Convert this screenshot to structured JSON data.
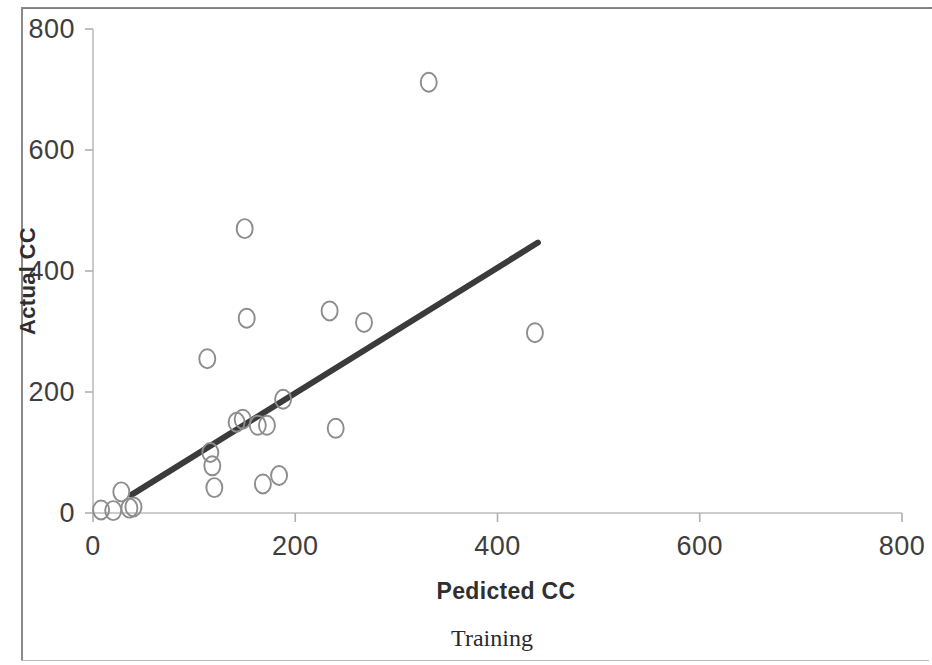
{
  "chart_data": {
    "type": "scatter",
    "title": "",
    "subtitle": "",
    "caption": "Training",
    "xlabel": "Pedicted CC",
    "ylabel": "Actual CC",
    "xlim": [
      0,
      800
    ],
    "ylim": [
      0,
      800
    ],
    "xticks": [
      0,
      200,
      400,
      600,
      800
    ],
    "yticks": [
      0,
      200,
      400,
      600,
      800
    ],
    "xtick_labels": [
      "0",
      "200",
      "400",
      "600",
      "800"
    ],
    "ytick_labels": [
      "0",
      "200",
      "400",
      "600",
      "800"
    ],
    "grid": false,
    "legend": null,
    "marker": {
      "shape": "open-circle",
      "stroke_color": "#8d8d8d",
      "fill": "none",
      "size": 18
    },
    "points": [
      {
        "x": 8,
        "y": 5
      },
      {
        "x": 20,
        "y": 4
      },
      {
        "x": 28,
        "y": 35
      },
      {
        "x": 36,
        "y": 8
      },
      {
        "x": 40,
        "y": 10
      },
      {
        "x": 113,
        "y": 255
      },
      {
        "x": 116,
        "y": 100
      },
      {
        "x": 118,
        "y": 78
      },
      {
        "x": 120,
        "y": 42
      },
      {
        "x": 142,
        "y": 150
      },
      {
        "x": 148,
        "y": 155
      },
      {
        "x": 150,
        "y": 470
      },
      {
        "x": 152,
        "y": 322
      },
      {
        "x": 163,
        "y": 145
      },
      {
        "x": 168,
        "y": 48
      },
      {
        "x": 172,
        "y": 145
      },
      {
        "x": 184,
        "y": 62
      },
      {
        "x": 188,
        "y": 188
      },
      {
        "x": 234,
        "y": 334
      },
      {
        "x": 240,
        "y": 140
      },
      {
        "x": 268,
        "y": 315
      },
      {
        "x": 332,
        "y": 712
      },
      {
        "x": 437,
        "y": 298
      }
    ],
    "trendline": {
      "type": "linear-fit",
      "color": "#3b3b3b",
      "width": 6,
      "x_start": 38,
      "y_start": 30,
      "x_end": 440,
      "y_end": 447
    },
    "axis_color": "#b0b0b0",
    "text_color": "#3e3e3e"
  },
  "axes": {
    "y_title": "Actual CC",
    "x_title": "Pedicted CC",
    "caption": "Training"
  }
}
